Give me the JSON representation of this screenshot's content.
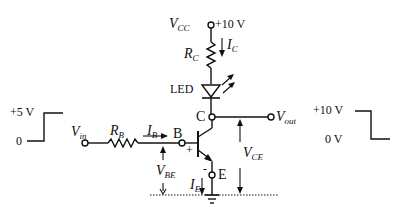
{
  "diagram": {
    "supply": {
      "name": "V",
      "sub": "CC",
      "value": "+10 V"
    },
    "collector_resistor": {
      "name": "R",
      "sub": "C"
    },
    "collector_current": {
      "name": "I",
      "sub": "C"
    },
    "led_label": "LED",
    "collector_node": "C",
    "base_node": "B",
    "emitter_node": "E",
    "base_resistor": {
      "name": "R",
      "sub": "B"
    },
    "base_current": {
      "name": "I",
      "sub": "B"
    },
    "emitter_current": {
      "name": "I",
      "sub": "E"
    },
    "input": {
      "name": "V",
      "sub": "in"
    },
    "output": {
      "name": "V",
      "sub": "out"
    },
    "vbe": {
      "name": "V",
      "sub": "BE"
    },
    "vce": {
      "name": "V",
      "sub": "CE"
    },
    "plus_sign": "+",
    "minus_sign": "-",
    "input_waveform": {
      "high_label": "+5 V",
      "low_label": "0"
    },
    "output_waveform": {
      "high_label": "+10 V",
      "low_label": "0 V"
    }
  }
}
